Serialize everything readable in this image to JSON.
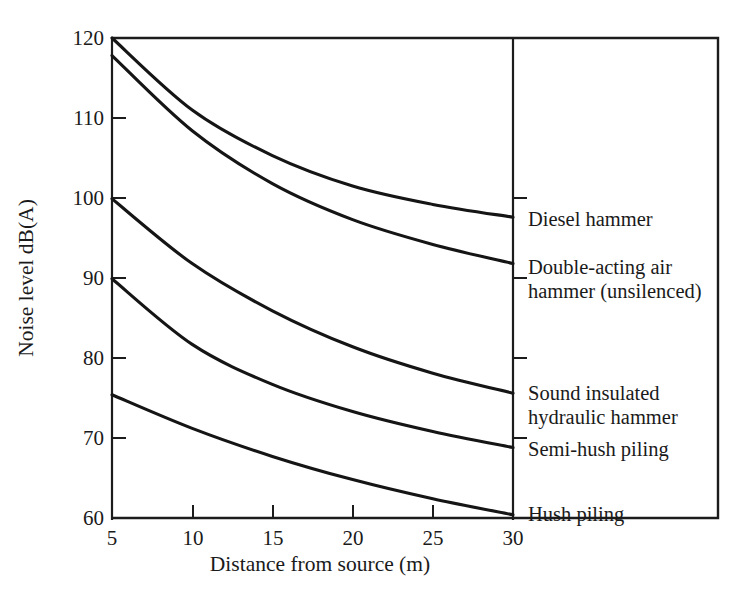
{
  "chart_data": {
    "type": "line",
    "title": "",
    "xlabel": "Distance from source (m)",
    "ylabel": "Noise level dB(A)",
    "xlim": [
      5,
      30
    ],
    "ylim": [
      60,
      120
    ],
    "xticks": [
      5,
      10,
      15,
      20,
      25,
      30
    ],
    "yticks": [
      60,
      70,
      80,
      90,
      100,
      110,
      120
    ],
    "grid": false,
    "legend_position": "right-of-plot-inline",
    "x": [
      5,
      10,
      15,
      20,
      25,
      30
    ],
    "series": [
      {
        "name": "Diesel hammer",
        "label": "Diesel hammer",
        "values": [
          120.0,
          111.0,
          105.3,
          101.5,
          99.2,
          97.6
        ]
      },
      {
        "name": "Double-acting air hammer (unsilenced)",
        "label": "Double-acting air\nhammer (unsilenced)",
        "values": [
          117.8,
          108.4,
          101.8,
          97.3,
          94.2,
          91.8
        ]
      },
      {
        "name": "Sound insulated hydraulic hammer",
        "label": "Sound insulated\nhydraulic hammer",
        "values": [
          99.9,
          91.8,
          85.9,
          81.4,
          78.1,
          75.6
        ]
      },
      {
        "name": "Semi-hush piling",
        "label": "Semi-hush piling",
        "values": [
          89.9,
          81.7,
          76.7,
          73.3,
          70.8,
          68.8
        ]
      },
      {
        "name": "Hush piling",
        "label": "Hush piling",
        "values": [
          75.4,
          71.2,
          67.7,
          64.8,
          62.4,
          60.4
        ]
      }
    ]
  },
  "axes": {
    "y_title": "Noise level dB(A)",
    "x_title": "Distance from source (m)",
    "y_tick_labels": [
      "120",
      "110",
      "100",
      "90",
      "80",
      "70",
      "60"
    ],
    "x_tick_labels": [
      "5",
      "10",
      "15",
      "20",
      "25",
      "30"
    ]
  },
  "legend": {
    "items": [
      {
        "label": "Diesel hammer"
      },
      {
        "label": "Double-acting air\nhammer (unsilenced)"
      },
      {
        "label": "Sound insulated\nhydraulic hammer"
      },
      {
        "label": "Semi-hush piling"
      },
      {
        "label": "Hush piling"
      }
    ]
  },
  "colors": {
    "ink": "#151515",
    "background": "#ffffff"
  }
}
